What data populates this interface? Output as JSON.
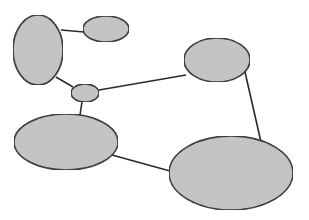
{
  "diagram": {
    "fill": "#c4c4c4",
    "stroke": "#2a2a2a",
    "nodes": [
      {
        "id": "A",
        "cx": 38,
        "cy": 50,
        "rx": 25,
        "ry": 35
      },
      {
        "id": "B",
        "cx": 106,
        "cy": 29,
        "rx": 23,
        "ry": 13
      },
      {
        "id": "C",
        "cx": 217,
        "cy": 60,
        "rx": 33,
        "ry": 22
      },
      {
        "id": "D",
        "cx": 85,
        "cy": 93,
        "rx": 14,
        "ry": 9
      },
      {
        "id": "E",
        "cx": 66,
        "cy": 142,
        "rx": 52,
        "ry": 28
      },
      {
        "id": "F",
        "cx": 231,
        "cy": 173,
        "rx": 62,
        "ry": 37
      }
    ],
    "edges": [
      {
        "from": "A",
        "to": "B",
        "x1": 61,
        "y1": 30,
        "x2": 84,
        "y2": 32
      },
      {
        "from": "A",
        "to": "D",
        "x1": 56,
        "y1": 77,
        "x2": 73,
        "y2": 87
      },
      {
        "from": "D",
        "to": "C",
        "x1": 99,
        "y1": 90,
        "x2": 186,
        "y2": 75
      },
      {
        "from": "D",
        "to": "E",
        "x1": 82,
        "y1": 102,
        "x2": 80,
        "y2": 115
      },
      {
        "from": "C",
        "to": "F",
        "x1": 245,
        "y1": 72,
        "x2": 261,
        "y2": 142
      },
      {
        "from": "E",
        "to": "F",
        "x1": 112,
        "y1": 155,
        "x2": 170,
        "y2": 171
      }
    ]
  }
}
